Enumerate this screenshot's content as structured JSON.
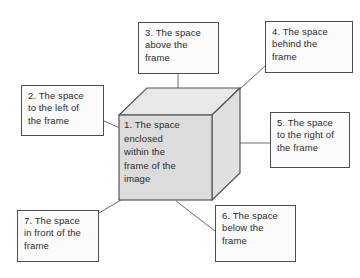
{
  "diagram": {
    "background_color": "#ffffff",
    "box_border_color": "#4d4d4d",
    "box_fill_color": "#fbfbfb",
    "connector_color": "#6e6e6e",
    "cube": {
      "front_face_color": "#dcdcdc",
      "top_face_color": "#e8e8e8",
      "right_face_color": "#e3e3e3",
      "edge_color": "#555555",
      "label": "1. The space\nenclosed\nwithin the\nframe of the\nimage"
    },
    "callouts": [
      {
        "id": "2",
        "text": "2. The space\nto the left of\nthe frame"
      },
      {
        "id": "3",
        "text": "3. The space\nabove the\nframe"
      },
      {
        "id": "4",
        "text": "4. The space\nbehind the\nframe"
      },
      {
        "id": "5",
        "text": "5. The space\nto the right of\nthe frame"
      },
      {
        "id": "6",
        "text": "6. The space\nbelow the\nframe"
      },
      {
        "id": "7",
        "text": "7. The space\nin front of the\nframe"
      }
    ]
  }
}
